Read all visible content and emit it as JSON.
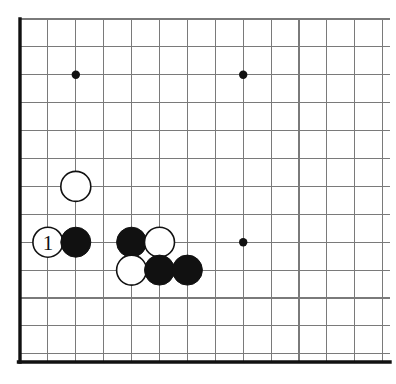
{
  "figure": {
    "kind": "go-board-diagram",
    "title": "",
    "background_color": "#ffffff",
    "line_color": "#7a7a7a",
    "edge_color": "#111111",
    "black_color": "#111111",
    "white_color": "#ffffff"
  },
  "board": {
    "origin_x": 20,
    "origin_y": 19,
    "spacing": 27.9,
    "columns": 14,
    "rows": 13,
    "left_edge_thick": true,
    "bottom_edge_thick": true,
    "top_edge_thick": false,
    "right_edge_thick": false,
    "bottom_edge_y": 362,
    "left_edge_x": 20,
    "clip_right_x": 390,
    "clip_top_y": 19
  },
  "star_points": [
    {
      "name": "upper-left-star",
      "col": 3,
      "row": 3
    },
    {
      "name": "upper-right-star",
      "col": 9,
      "row": 3
    },
    {
      "name": "lower-right-star",
      "col": 9,
      "row": 9
    }
  ],
  "stones": [
    {
      "id": "white-extension",
      "color": "white",
      "col": 3,
      "row": 7,
      "label": ""
    },
    {
      "id": "white-move-1",
      "color": "white",
      "col": 2,
      "row": 9,
      "label": "1"
    },
    {
      "id": "black-a",
      "color": "black",
      "col": 3,
      "row": 9,
      "label": ""
    },
    {
      "id": "black-b",
      "color": "black",
      "col": 5,
      "row": 9,
      "label": ""
    },
    {
      "id": "white-c",
      "color": "white",
      "col": 6,
      "row": 9,
      "label": ""
    },
    {
      "id": "white-d",
      "color": "white",
      "col": 5,
      "row": 10,
      "label": ""
    },
    {
      "id": "black-e",
      "color": "black",
      "col": 6,
      "row": 10,
      "label": ""
    },
    {
      "id": "black-f",
      "color": "black",
      "col": 7,
      "row": 10,
      "label": ""
    }
  ],
  "stone_style": {
    "radius": 15,
    "star_radius": 4.2,
    "label_font_size": 21
  }
}
